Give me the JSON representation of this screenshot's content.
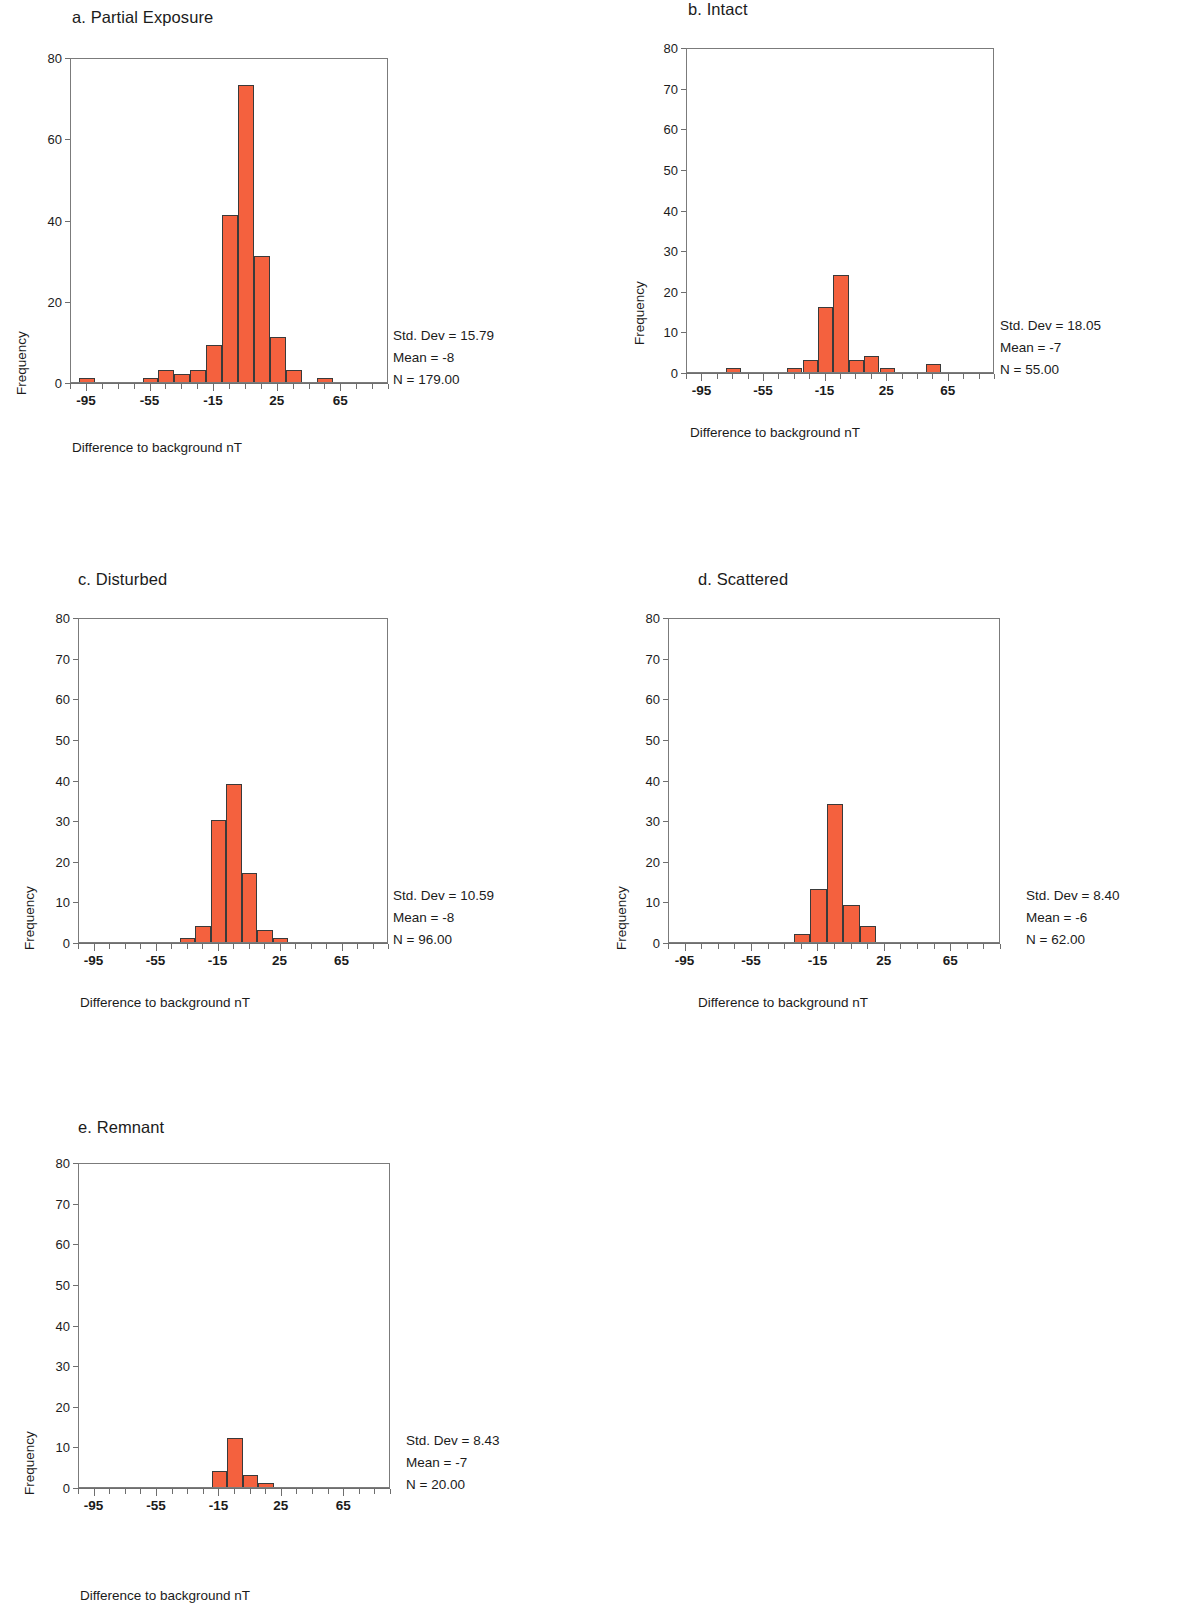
{
  "figure": {
    "background": "#ffffff",
    "bar_fill": "#f4613e",
    "bar_stroke": "#3a3a3a",
    "axis_color": "#6e6e6e",
    "text_color": "#1b1b1b"
  },
  "common": {
    "xlabel": "Difference to background nT",
    "ylabel": "Frequency",
    "xlim": [
      -105,
      95
    ],
    "ylim": [
      0,
      80
    ],
    "bin_width": 10,
    "x_major_ticks": [
      -95,
      -55,
      -15,
      25,
      65
    ],
    "x_major_tick_labels": [
      "-95",
      "-55",
      "-15",
      "25",
      "65"
    ],
    "stat_labels": {
      "std": "Std. Dev = ",
      "mean": "Mean = ",
      "n": "N = "
    }
  },
  "chart_data": [
    {
      "id": "a",
      "type": "bar",
      "title": "a.  Partial Exposure",
      "xlabel": "Difference to background nT",
      "ylabel": "Frequency",
      "xlim": [
        -105,
        95
      ],
      "ylim": [
        0,
        80
      ],
      "y_ticks": [
        0,
        20,
        40,
        60,
        80
      ],
      "y_tick_labels": [
        "0",
        "20",
        "40",
        "60",
        "80"
      ],
      "y_minor_step": 10,
      "grid": false,
      "legend": "none",
      "bin_width": 10,
      "bin_centers": [
        -95,
        -85,
        -75,
        -65,
        -55,
        -45,
        -35,
        -25,
        -15,
        -5,
        5,
        15,
        25,
        35,
        45,
        55,
        65,
        75,
        85
      ],
      "values": [
        1,
        0,
        0,
        0,
        1,
        3,
        2,
        3,
        9,
        41,
        73,
        31,
        11,
        3,
        0,
        1,
        0,
        0,
        0
      ],
      "stats": {
        "std_dev": "15.79",
        "mean": "-8",
        "n": "179.00"
      },
      "stat_lines": [
        "Std. Dev = 15.79",
        "Mean = -8",
        "N = 179.00"
      ]
    },
    {
      "id": "b",
      "type": "bar",
      "title": "b.  Intact",
      "xlabel": "Difference to background nT",
      "ylabel": "Frequency",
      "xlim": [
        -105,
        95
      ],
      "ylim": [
        0,
        80
      ],
      "y_ticks": [
        0,
        10,
        20,
        30,
        40,
        50,
        60,
        70,
        80
      ],
      "y_tick_labels": [
        "0",
        "10",
        "20",
        "30",
        "40",
        "50",
        "60",
        "70",
        "80"
      ],
      "y_minor_step": 10,
      "grid": false,
      "legend": "none",
      "bin_width": 10,
      "bin_centers": [
        -95,
        -85,
        -75,
        -65,
        -55,
        -45,
        -35,
        -25,
        -15,
        -5,
        5,
        15,
        25,
        35,
        45,
        55,
        65,
        75,
        85
      ],
      "values": [
        0,
        0,
        1,
        0,
        0,
        0,
        1,
        3,
        16,
        24,
        3,
        4,
        1,
        0,
        0,
        2,
        0,
        0,
        0
      ],
      "stats": {
        "std_dev": "18.05",
        "mean": "-7",
        "n": "55.00"
      },
      "stat_lines": [
        "Std. Dev = 18.05",
        "Mean = -7",
        "N = 55.00"
      ]
    },
    {
      "id": "c",
      "type": "bar",
      "title": "c.  Disturbed",
      "xlabel": "Difference to background nT",
      "ylabel": "Frequency",
      "xlim": [
        -105,
        95
      ],
      "ylim": [
        0,
        80
      ],
      "y_ticks": [
        0,
        10,
        20,
        30,
        40,
        50,
        60,
        70,
        80
      ],
      "y_tick_labels": [
        "0",
        "10",
        "20",
        "30",
        "40",
        "50",
        "60",
        "70",
        "80"
      ],
      "y_minor_step": 10,
      "grid": false,
      "legend": "none",
      "bin_width": 10,
      "bin_centers": [
        -95,
        -85,
        -75,
        -65,
        -55,
        -45,
        -35,
        -25,
        -15,
        -5,
        5,
        15,
        25,
        35,
        45,
        55,
        65,
        75,
        85
      ],
      "values": [
        0,
        0,
        0,
        0,
        0,
        0,
        1,
        4,
        30,
        39,
        17,
        3,
        1,
        0,
        0,
        0,
        0,
        0,
        0
      ],
      "stats": {
        "std_dev": "10.59",
        "mean": "-8",
        "n": "96.00"
      },
      "stat_lines": [
        "Std. Dev = 10.59",
        "Mean = -8",
        "N = 96.00"
      ]
    },
    {
      "id": "d",
      "type": "bar",
      "title": "d.  Scattered",
      "xlabel": "Difference to background nT",
      "ylabel": "Frequency",
      "xlim": [
        -105,
        95
      ],
      "ylim": [
        0,
        80
      ],
      "y_ticks": [
        0,
        10,
        20,
        30,
        40,
        50,
        60,
        70,
        80
      ],
      "y_tick_labels": [
        "0",
        "10",
        "20",
        "30",
        "40",
        "50",
        "60",
        "70",
        "80"
      ],
      "y_minor_step": 10,
      "grid": false,
      "legend": "none",
      "bin_width": 10,
      "bin_centers": [
        -95,
        -85,
        -75,
        -65,
        -55,
        -45,
        -35,
        -25,
        -15,
        -5,
        5,
        15,
        25,
        35,
        45,
        55,
        65,
        75,
        85
      ],
      "values": [
        0,
        0,
        0,
        0,
        0,
        0,
        0,
        2,
        13,
        34,
        9,
        4,
        0,
        0,
        0,
        0,
        0,
        0,
        0
      ],
      "stats": {
        "std_dev": "8.40",
        "mean": "-6",
        "n": "62.00"
      },
      "stat_lines": [
        "Std. Dev = 8.40",
        "Mean = -6",
        "N = 62.00"
      ]
    },
    {
      "id": "e",
      "type": "bar",
      "title": "e.  Remnant",
      "xlabel": "Difference to background nT",
      "ylabel": "Frequency",
      "xlim": [
        -105,
        95
      ],
      "ylim": [
        0,
        80
      ],
      "y_ticks": [
        0,
        10,
        20,
        30,
        40,
        50,
        60,
        70,
        80
      ],
      "y_tick_labels": [
        "0",
        "10",
        "20",
        "30",
        "40",
        "50",
        "60",
        "70",
        "80"
      ],
      "y_minor_step": 10,
      "grid": false,
      "legend": "none",
      "bin_width": 10,
      "bin_centers": [
        -95,
        -85,
        -75,
        -65,
        -55,
        -45,
        -35,
        -25,
        -15,
        -5,
        5,
        15,
        25,
        35,
        45,
        55,
        65,
        75,
        85
      ],
      "values": [
        0,
        0,
        0,
        0,
        0,
        0,
        0,
        0,
        4,
        12,
        3,
        1,
        0,
        0,
        0,
        0,
        0,
        0,
        0
      ],
      "stats": {
        "std_dev": "8.43",
        "mean": "-7",
        "n": "20.00"
      },
      "stat_lines": [
        "Std. Dev = 8.43",
        "Mean = -7",
        "N = 20.00"
      ]
    }
  ],
  "layout": {
    "panels": [
      {
        "id": "a",
        "left": 0,
        "top": 0,
        "title_left": 72,
        "title_top": 8,
        "plot_left": 70,
        "plot_top": 58,
        "plot_w": 318,
        "plot_h": 325,
        "stats_left": 393,
        "stats_top": 325,
        "xlabel_left": 72,
        "xlabel_top": 440,
        "ylabel_left": 14,
        "ylabel_top": 395
      },
      {
        "id": "b",
        "left": 0,
        "top": 0,
        "title_left": 688,
        "title_top": 0,
        "plot_left": 686,
        "plot_top": 48,
        "plot_w": 308,
        "plot_h": 325,
        "stats_left": 1000,
        "stats_top": 315,
        "xlabel_left": 690,
        "xlabel_top": 425,
        "ylabel_left": 632,
        "ylabel_top": 345
      },
      {
        "id": "c",
        "left": 0,
        "top": 0,
        "title_left": 78,
        "title_top": 570,
        "plot_left": 78,
        "plot_top": 618,
        "plot_w": 310,
        "plot_h": 325,
        "stats_left": 393,
        "stats_top": 885,
        "xlabel_left": 80,
        "xlabel_top": 995,
        "ylabel_left": 22,
        "ylabel_top": 950
      },
      {
        "id": "d",
        "left": 0,
        "top": 0,
        "title_left": 698,
        "title_top": 570,
        "plot_left": 668,
        "plot_top": 618,
        "plot_w": 332,
        "plot_h": 325,
        "stats_left": 1026,
        "stats_top": 885,
        "xlabel_left": 698,
        "xlabel_top": 995,
        "ylabel_left": 614,
        "ylabel_top": 950
      },
      {
        "id": "e",
        "left": 0,
        "top": 0,
        "title_left": 78,
        "title_top": 1118,
        "plot_left": 78,
        "plot_top": 1163,
        "plot_w": 312,
        "plot_h": 325,
        "stats_left": 406,
        "stats_top": 1430,
        "xlabel_left": 80,
        "xlabel_top": 1588,
        "ylabel_left": 22,
        "ylabel_top": 1495
      }
    ]
  }
}
